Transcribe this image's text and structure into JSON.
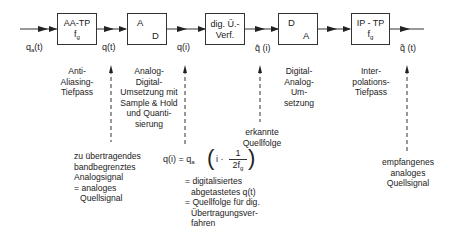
{
  "input_signal": "q_a(t)",
  "blocks": [
    {
      "id": "aa-tp",
      "title": "AA-TP",
      "param": "f",
      "param_sub": "g"
    },
    {
      "id": "ad",
      "top_letter": "A",
      "bottom_letter": "D"
    },
    {
      "id": "dig",
      "line1": "dig. Ü.-",
      "line2": "Verf."
    },
    {
      "id": "da",
      "top_letter": "D",
      "bottom_letter": "A"
    },
    {
      "id": "ip-tp",
      "title": "IP - TP",
      "param": "f",
      "param_sub": "g"
    }
  ],
  "signals": {
    "q_a": {
      "base": "q",
      "sub": "a",
      "arg": "(t)"
    },
    "q_t": "q(t)",
    "q_i": "q(i)",
    "q_hat_i": "q̂ (i)",
    "q_tilde_t": "q̃ (t)"
  },
  "descriptions": {
    "aa": [
      "Anti-",
      "Aliasing-",
      "Tiefpass"
    ],
    "ad": [
      "Analog-",
      "Digital-",
      "Umsetzung mit",
      "Sample & Hold",
      "und Quanti-",
      "sierung"
    ],
    "da": [
      "Digital-",
      "Analog-",
      "Um-",
      "setzung"
    ],
    "ip": [
      "Inter-",
      "polations-",
      "Tiefpass"
    ],
    "input_note": [
      "zu übertragendes",
      "bandbegrenztes",
      "Analogsignal",
      "= analoges",
      "  Quellsignal"
    ],
    "erkannt": [
      "erkannte",
      "Quellfolge"
    ],
    "output_note": [
      "empfangenes",
      "analoges",
      "Quellsignal"
    ],
    "formula_notes": [
      "= digitalisiertes",
      "  abgetastetes q(t)",
      "= Quellfolge für dig.",
      "  Übertragungsver-",
      "  fahren"
    ]
  },
  "formula": {
    "lhs": "q(i) = q",
    "lhs_sub": "a",
    "inner": "i ·",
    "numerator": "1",
    "denominator": "2f",
    "denominator_sub": "g"
  }
}
